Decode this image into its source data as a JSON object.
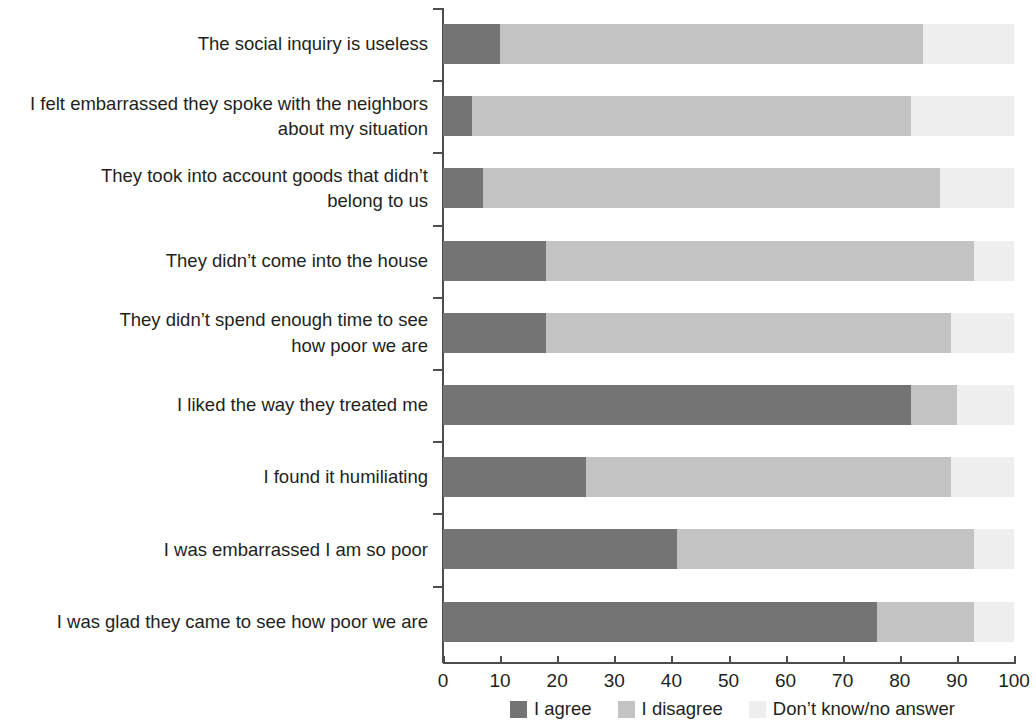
{
  "chart_data": {
    "type": "bar",
    "orientation": "horizontal",
    "stacked": true,
    "title": "",
    "subtitle": "",
    "xlabel": "",
    "ylabel": "",
    "xlim": [
      0,
      100
    ],
    "xticks": [
      0,
      10,
      20,
      30,
      40,
      50,
      60,
      70,
      80,
      90,
      100
    ],
    "grid": false,
    "legend_position": "bottom",
    "categories": [
      "The social inquiry is useless",
      "I felt embarrassed they spoke with the neighbors about my situation",
      "They took into account goods that didn’t belong to us",
      "They didn’t come into the house",
      "They didn’t spend enough time to see how poor we are",
      "I liked the way they treated me",
      "I found it humiliating",
      "I was embarrassed I am so poor",
      "I was glad they came to see how poor we are"
    ],
    "series": [
      {
        "name": "I agree",
        "color": "#747474",
        "values": [
          10,
          5,
          7,
          18,
          18,
          82,
          25,
          41,
          76
        ]
      },
      {
        "name": "I disagree",
        "color": "#c3c3c3",
        "values": [
          74,
          77,
          80,
          75,
          71,
          8,
          64,
          52,
          17
        ]
      },
      {
        "name": "Don’t know/no answer",
        "color": "#eeeeee",
        "values": [
          16,
          18,
          13,
          7,
          11,
          10,
          11,
          7,
          7
        ]
      }
    ]
  },
  "axis": {
    "tick_labels": [
      "0",
      "10",
      "20",
      "30",
      "40",
      "50",
      "60",
      "70",
      "80",
      "90",
      "100"
    ]
  },
  "legend": {
    "items": [
      {
        "label": "I agree",
        "color": "#747474"
      },
      {
        "label": "I disagree",
        "color": "#c3c3c3"
      },
      {
        "label": "Don’t know/no answer",
        "color": "#eeeeee"
      }
    ]
  },
  "category_labels": [
    {
      "lines": [
        "The social inquiry is useless"
      ]
    },
    {
      "lines": [
        "I felt embarrassed they spoke with the neighbors",
        "about my situation"
      ]
    },
    {
      "lines": [
        "They took into account goods that didn’t",
        "belong to us"
      ]
    },
    {
      "lines": [
        "They didn’t come into the house"
      ]
    },
    {
      "lines": [
        "They didn’t spend enough time to see",
        "how poor we are"
      ]
    },
    {
      "lines": [
        "I liked the way they treated me"
      ]
    },
    {
      "lines": [
        "I found it humiliating"
      ]
    },
    {
      "lines": [
        "I was embarrassed I am so poor"
      ]
    },
    {
      "lines": [
        "I was glad they came to see how poor we are"
      ]
    }
  ]
}
